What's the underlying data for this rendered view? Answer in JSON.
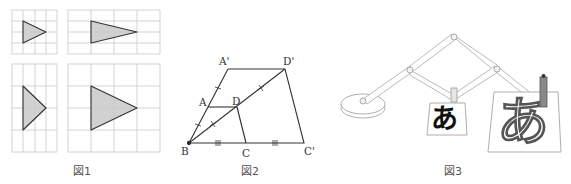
{
  "figures": [
    {
      "id": "fig1",
      "caption": "図1",
      "description": "Four grids each showing a shaded triangle; horizontal and vertical stretches of a base triangle",
      "grids": [
        {
          "position": "top-left",
          "cols": 4,
          "rows": 4,
          "triangle": [
            [
              1,
              1
            ],
            [
              1,
              3
            ],
            [
              3,
              2
            ]
          ]
        },
        {
          "position": "top-right",
          "cols": 4,
          "rows": 4,
          "triangle": [
            [
              1,
              1
            ],
            [
              1,
              3
            ],
            [
              3,
              2
            ]
          ],
          "note": "stretched horizontally x2"
        },
        {
          "position": "bottom-left",
          "cols": 4,
          "rows": 4,
          "triangle": [
            [
              1,
              1
            ],
            [
              1,
              3
            ],
            [
              3,
              2
            ]
          ],
          "note": "stretched vertically x2"
        },
        {
          "position": "bottom-right",
          "cols": 4,
          "rows": 4,
          "triangle": [
            [
              1,
              1
            ],
            [
              1,
              3
            ],
            [
              3,
              2
            ]
          ],
          "note": "enlarged x2"
        }
      ],
      "colors": {
        "grid": "#c8c8c8",
        "triangle_fill": "#c9c9c9",
        "triangle_stroke": "#333333"
      }
    },
    {
      "id": "fig2",
      "caption": "図2",
      "description": "Homothety centered at B: quadrilateral ABCD enlarged to A'BC'D'",
      "points": {
        "A_prime": "A'",
        "D_prime": "D'",
        "A": "A",
        "D": "D",
        "B": "B",
        "C": "C",
        "C_prime": "C'"
      },
      "tick_marks": {
        "BA_AA'": "single",
        "BD_DD'": "double-x",
        "BC_CC'": "triple"
      }
    },
    {
      "id": "fig3",
      "caption": "図3",
      "description": "Pantograph enlarging the hiragana character",
      "small_char": "あ",
      "large_char": "あ"
    }
  ]
}
